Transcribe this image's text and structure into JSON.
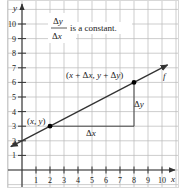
{
  "chart_data": {
    "type": "line",
    "title": "",
    "xlabel": "x",
    "ylabel": "y",
    "xlim": [
      0,
      10
    ],
    "ylim": [
      0,
      10
    ],
    "grid": true,
    "x_ticks": [
      "1",
      "2",
      "3",
      "4",
      "5",
      "6",
      "7",
      "8",
      "9",
      "10"
    ],
    "y_ticks": [
      "1",
      "2",
      "3",
      "4",
      "5",
      "6",
      "7",
      "8",
      "9",
      "10"
    ],
    "series": [
      {
        "name": "f",
        "equation": "y = 0.5x + 2",
        "x": [
          -0.8,
          10.4
        ],
        "y": [
          1.6,
          7.2
        ],
        "arrows": "both"
      }
    ],
    "points": [
      {
        "label": "(x, y)",
        "x": 2,
        "y": 3
      },
      {
        "label": "(x + Δx, y + Δy)",
        "x": 8,
        "y": 6
      }
    ],
    "annotations": {
      "fraction_numerator": "Δy",
      "fraction_denominator": "Δx",
      "fraction_text": "is a constant.",
      "delta_x": "Δx",
      "delta_y": "Δy",
      "function_label": "f"
    },
    "colors": {
      "line": "#333333",
      "grid": "#b5b5b5",
      "axis": "#333333",
      "point": "#000000"
    }
  }
}
